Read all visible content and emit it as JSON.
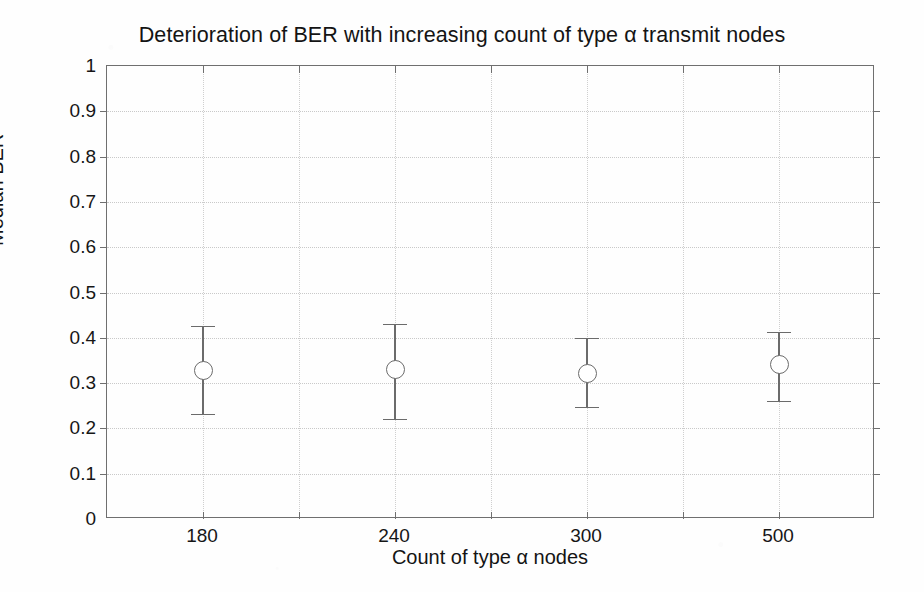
{
  "chart_data": {
    "type": "scatter",
    "title": "Deterioration of BER with increasing count of type α transmit nodes",
    "xlabel": "Count of type α nodes",
    "ylabel": "Median BER",
    "categories": [
      "180",
      "240",
      "300",
      "500"
    ],
    "values": [
      0.328,
      0.33,
      0.322,
      0.34
    ],
    "error_upper": [
      0.425,
      0.43,
      0.4,
      0.412
    ],
    "error_lower": [
      0.232,
      0.22,
      0.247,
      0.26
    ],
    "series": [
      {
        "name": "Median BER",
        "values": [
          0.328,
          0.33,
          0.322,
          0.34
        ],
        "error_upper": [
          0.425,
          0.43,
          0.4,
          0.412
        ],
        "error_lower": [
          0.232,
          0.22,
          0.247,
          0.26
        ],
        "marker": "open-circle"
      }
    ],
    "ylim": [
      0,
      1
    ],
    "y_ticks": [
      "0",
      "0.1",
      "0.2",
      "0.3",
      "0.4",
      "0.5",
      "0.6",
      "0.7",
      "0.8",
      "0.9",
      "1"
    ],
    "y_tick_values": [
      0,
      0.1,
      0.2,
      0.3,
      0.4,
      0.5,
      0.6,
      0.7,
      0.8,
      0.9,
      1
    ],
    "x_tick_labels": [
      "",
      "180",
      "",
      "240",
      "",
      "300",
      "",
      "500",
      ""
    ],
    "x_tick_slots": 9,
    "grid": true,
    "grid_style": "dotted",
    "legend": null,
    "legend_position": "none",
    "marker_color": "#6b6b6b",
    "axis_color": "#6f6f6f",
    "grid_color": "#c9c9c9",
    "background": "#ffffff"
  }
}
